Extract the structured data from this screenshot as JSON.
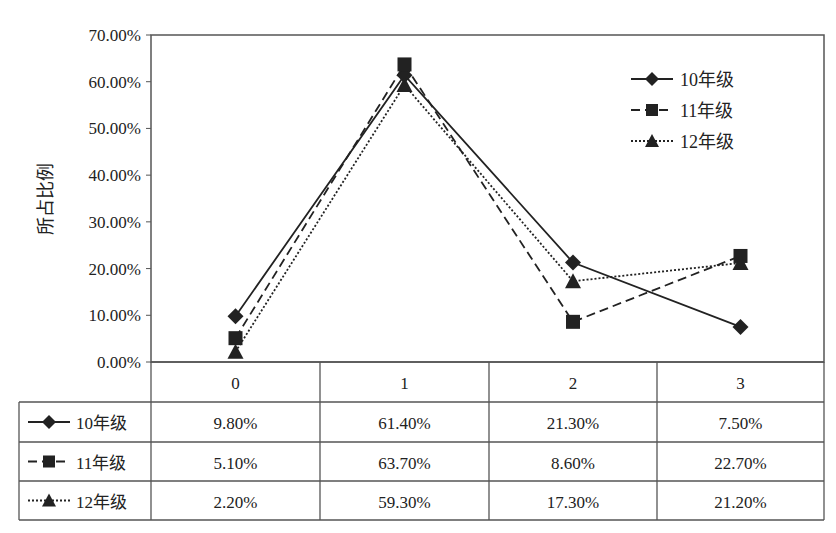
{
  "chart_data": {
    "type": "line",
    "title": "",
    "xlabel": "",
    "ylabel": "所占比例",
    "ylim": [
      0,
      70
    ],
    "y_ticks": [
      "0.00%",
      "10.00%",
      "20.00%",
      "30.00%",
      "40.00%",
      "50.00%",
      "60.00%",
      "70.00%"
    ],
    "categories": [
      "0",
      "1",
      "2",
      "3"
    ],
    "grid": false,
    "legend_position": "top-right",
    "series": [
      {
        "name": "10年级",
        "marker": "diamond",
        "line_style": "solid",
        "values": [
          9.8,
          61.4,
          21.3,
          7.5
        ],
        "labels": [
          "9.80%",
          "61.40%",
          "21.30%",
          "7.50%"
        ]
      },
      {
        "name": "11年级",
        "marker": "square",
        "line_style": "dashed",
        "values": [
          5.1,
          63.7,
          8.6,
          22.7
        ],
        "labels": [
          "5.10%",
          "63.70%",
          "8.60%",
          "22.70%"
        ]
      },
      {
        "name": "12年级",
        "marker": "triangle",
        "line_style": "dotted",
        "values": [
          2.2,
          59.3,
          17.3,
          21.2
        ],
        "labels": [
          "2.20%",
          "59.30%",
          "17.30%",
          "21.20%"
        ]
      }
    ],
    "data_table": true
  },
  "colors": {
    "line": "#222222",
    "frame": "#555555",
    "background": "#ffffff"
  }
}
